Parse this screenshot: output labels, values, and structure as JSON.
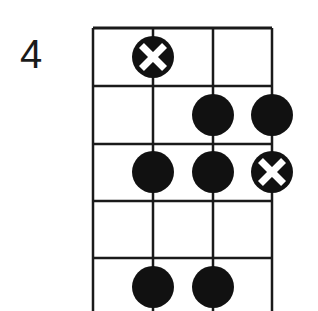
{
  "diagram": {
    "fret_label": "4",
    "grid": {
      "x_lines": [
        93,
        153,
        213,
        272
      ],
      "y_top": 28,
      "y_frets": [
        28,
        86,
        144,
        201,
        258
      ],
      "y_bottom": 311,
      "line_color": "#1a1a1a"
    },
    "dot_radius": 21,
    "dot_color": "#111111",
    "markers": [
      {
        "type": "root",
        "string": 2,
        "fret": 1,
        "cx": 153,
        "cy": 57
      },
      {
        "type": "note",
        "string": 3,
        "fret": 2,
        "cx": 213,
        "cy": 115
      },
      {
        "type": "note",
        "string": 4,
        "fret": 2,
        "cx": 272,
        "cy": 115
      },
      {
        "type": "note",
        "string": 2,
        "fret": 3,
        "cx": 153,
        "cy": 172
      },
      {
        "type": "note",
        "string": 3,
        "fret": 3,
        "cx": 213,
        "cy": 172
      },
      {
        "type": "root",
        "string": 4,
        "fret": 3,
        "cx": 272,
        "cy": 172
      },
      {
        "type": "note",
        "string": 2,
        "fret": 5,
        "cx": 153,
        "cy": 287
      },
      {
        "type": "note",
        "string": 3,
        "fret": 5,
        "cx": 213,
        "cy": 287
      }
    ]
  }
}
